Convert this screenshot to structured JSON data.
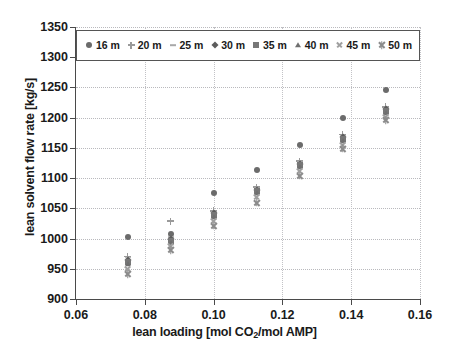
{
  "chart_data": {
    "type": "scatter",
    "title": "",
    "xlabel": "lean loading [mol CO2/mol AMP]",
    "xlabel_main": "lean loading [mol CO",
    "xlabel_sub": "2",
    "xlabel_tail": "/mol AMP]",
    "ylabel": "lean solvent flow rate [kg/s]",
    "xlim": [
      0.06,
      0.16
    ],
    "ylim": [
      900,
      1350
    ],
    "xticks": [
      0.06,
      0.08,
      0.1,
      0.12,
      0.14,
      0.16
    ],
    "xticklabels": [
      "0.06",
      "0.08",
      "0.10",
      "0.12",
      "0.14",
      "0.16"
    ],
    "yticks": [
      900,
      950,
      1000,
      1050,
      1100,
      1150,
      1200,
      1250,
      1300,
      1350
    ],
    "yticklabels": [
      "900",
      "950",
      "1000",
      "1050",
      "1100",
      "1150",
      "1200",
      "1250",
      "1300",
      "1350"
    ],
    "grid": true,
    "grid_axis": "both",
    "legend_position": "upper center",
    "x": [
      0.075,
      0.0875,
      0.1,
      0.1125,
      0.125,
      0.1375,
      0.15
    ],
    "series": [
      {
        "name": "16 m",
        "marker": "circle",
        "color": "#6b6b6b",
        "values": [
          1003,
          1008,
          1076,
          1114,
          1155,
          1199,
          1245
        ]
      },
      {
        "name": "20 m",
        "marker": "plus",
        "color": "#9a9a9a",
        "values": [
          970,
          1029,
          1046,
          1085,
          1128,
          1172,
          1218
        ]
      },
      {
        "name": "25 m",
        "marker": "dash",
        "color": "#a8a8a8",
        "values": [
          968,
          1002,
          1044,
          1083,
          1126,
          1170,
          1216
        ]
      },
      {
        "name": "30 m",
        "marker": "diamond",
        "color": "#5c5c5c",
        "values": [
          965,
          999,
          1042,
          1081,
          1124,
          1168,
          1214
        ]
      },
      {
        "name": "35 m",
        "marker": "square",
        "color": "#777777",
        "values": [
          962,
          996,
          1039,
          1078,
          1121,
          1165,
          1211
        ]
      },
      {
        "name": "40 m",
        "marker": "triangle",
        "color": "#6f6f6f",
        "values": [
          958,
          993,
          1036,
          1075,
          1118,
          1162,
          1208
        ]
      },
      {
        "name": "45 m",
        "marker": "cross",
        "color": "#9f9f9f",
        "values": [
          950,
          988,
          1030,
          1069,
          1112,
          1156,
          1202
        ]
      },
      {
        "name": "50 m",
        "marker": "star",
        "color": "#8c8c8c",
        "values": [
          941,
          981,
          1021,
          1060,
          1104,
          1149,
          1196
        ]
      }
    ]
  },
  "legend": {
    "items": [
      {
        "label": "16 m",
        "marker": "circle"
      },
      {
        "label": "20 m",
        "marker": "plus"
      },
      {
        "label": "25 m",
        "marker": "dash"
      },
      {
        "label": "30 m",
        "marker": "diamond"
      },
      {
        "label": "35 m",
        "marker": "square"
      },
      {
        "label": "40 m",
        "marker": "triangle"
      },
      {
        "label": "45 m",
        "marker": "cross"
      },
      {
        "label": "50 m",
        "marker": "star"
      }
    ]
  }
}
